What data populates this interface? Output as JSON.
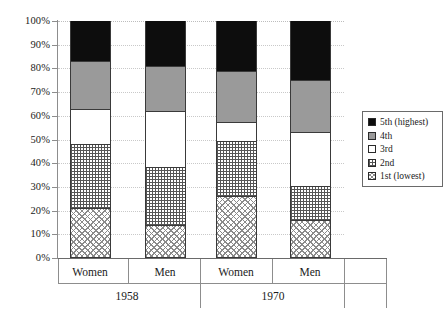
{
  "chart_data": {
    "type": "bar",
    "subtype": "stacked-100-percent",
    "title": "",
    "xlabel": "",
    "ylabel": "",
    "ylim": [
      0,
      100
    ],
    "yticks": [
      "0%",
      "10%",
      "20%",
      "30%",
      "40%",
      "50%",
      "60%",
      "70%",
      "80%",
      "90%",
      "100%"
    ],
    "grid": true,
    "legend_position": "right",
    "categories": [
      "Women",
      "Men",
      "Women",
      "Men"
    ],
    "groups": [
      {
        "label": "1958",
        "categories": [
          "Women",
          "Men"
        ]
      },
      {
        "label": "1970",
        "categories": [
          "Women",
          "Men"
        ]
      }
    ],
    "series": [
      {
        "name": "1st (lowest)",
        "key": "s1",
        "color": "#ffffff",
        "pattern": "cross-hatch-diagonal",
        "values": [
          21.0,
          14.0,
          26.0,
          16.0
        ]
      },
      {
        "name": "2nd",
        "key": "s2",
        "color": "#ffffff",
        "pattern": "fine-dot-grid",
        "values": [
          27.0,
          24.5,
          23.5,
          14.5
        ]
      },
      {
        "name": "3rd",
        "key": "s3",
        "color": "#ffffff",
        "pattern": "solid",
        "values": [
          15.0,
          23.5,
          8.0,
          22.5
        ]
      },
      {
        "name": "4th",
        "key": "s4",
        "color": "#9a9a9a",
        "pattern": "solid",
        "values": [
          20.0,
          19.0,
          21.5,
          22.0
        ]
      },
      {
        "name": "5th (highest)",
        "key": "s5",
        "color": "#0d0d0d",
        "pattern": "solid",
        "values": [
          17.0,
          19.0,
          21.0,
          25.0
        ]
      }
    ],
    "cumulative_tops": [
      [
        21.0,
        48.0,
        63.0,
        83.0,
        100.0
      ],
      [
        14.0,
        38.5,
        62.0,
        81.0,
        100.0
      ],
      [
        26.0,
        49.5,
        57.5,
        79.0,
        100.0
      ],
      [
        16.0,
        30.5,
        53.0,
        75.0,
        100.0
      ]
    ]
  },
  "legend": {
    "items": [
      {
        "label": "5th (highest)",
        "key": "s5"
      },
      {
        "label": "4th",
        "key": "s4"
      },
      {
        "label": "3rd",
        "key": "s3"
      },
      {
        "label": "2nd",
        "key": "s2"
      },
      {
        "label": "1st (lowest)",
        "key": "s1"
      }
    ]
  },
  "axis": {
    "y": {
      "ticks": [
        {
          "label": "100%",
          "value": 100
        },
        {
          "label": "90%",
          "value": 90
        },
        {
          "label": "80%",
          "value": 80
        },
        {
          "label": "70%",
          "value": 70
        },
        {
          "label": "60%",
          "value": 60
        },
        {
          "label": "50%",
          "value": 50
        },
        {
          "label": "40%",
          "value": 40
        },
        {
          "label": "30%",
          "value": 30
        },
        {
          "label": "20%",
          "value": 20
        },
        {
          "label": "10%",
          "value": 10
        },
        {
          "label": "0%",
          "value": 0
        }
      ]
    },
    "x": {
      "tick_labels": [
        "Women",
        "Men",
        "Women",
        "Men"
      ],
      "group_labels": [
        "1958",
        "1970"
      ]
    }
  }
}
